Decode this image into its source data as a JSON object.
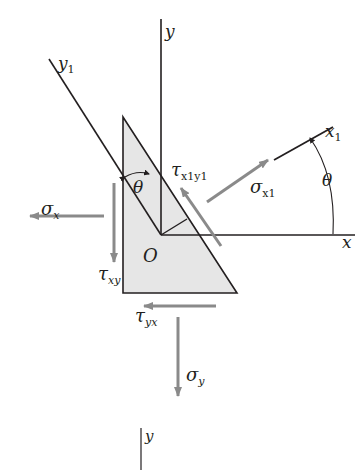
{
  "diagram": {
    "type": "stress-element-rotation",
    "colors": {
      "line": "#231f20",
      "arrow": "#8a8a8a",
      "fill": "#e6e6e6",
      "background": "#ffffff"
    },
    "axes": {
      "y_label": "y",
      "x_label": "x",
      "y1_label": "y",
      "y1_sub": "1",
      "x1_label": "x",
      "x1_sub": "1",
      "bottom_y_label": "y"
    },
    "origin_label": "O",
    "angles": {
      "theta_inner": "θ",
      "theta_outer": "θ"
    },
    "stresses": {
      "sigma_x": {
        "symbol": "σ",
        "sub": "x"
      },
      "tau_xy": {
        "symbol": "τ",
        "sub": "xy"
      },
      "tau_yx": {
        "symbol": "τ",
        "sub": "yx"
      },
      "sigma_y": {
        "symbol": "σ",
        "sub": "y"
      },
      "sigma_x1": {
        "symbol": "σ",
        "sub": "x1"
      },
      "tau_x1y1": {
        "symbol": "τ",
        "sub": "x1y1"
      }
    }
  }
}
